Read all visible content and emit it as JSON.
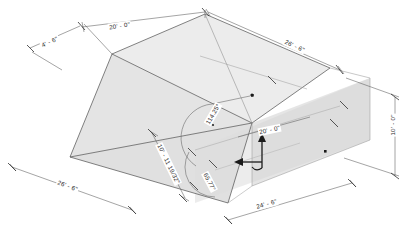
{
  "view": {
    "name": "3d-isometric-model-view",
    "background_color": "#ffffff",
    "line_color": "#4a4a4a",
    "dim_line_color": "#5a5a5a",
    "face_fill_top": "#e9e9e9",
    "face_fill_front": "#dedede",
    "face_fill_side": "#d6d6d6",
    "text_color": "#2b2b2b"
  },
  "dimensions": {
    "top_left_short": {
      "label": "4' - 6\"",
      "rotation": -29
    },
    "top_ridge": {
      "label": "20' - 0\"",
      "rotation": -17
    },
    "top_right_long": {
      "label": "26' - 6\"",
      "rotation": 27
    },
    "right_height": {
      "label": "10' - 0\"",
      "rotation": -90
    },
    "bottom_right_base": {
      "label": "24' - 6\"",
      "rotation": 12
    },
    "bottom_left_base": {
      "label": "26' - 6\"",
      "rotation": 27
    },
    "slope_length": {
      "label": "10' - 11 19/32\"",
      "rotation": 63
    },
    "interior_run": {
      "label": "20' - 0\"",
      "rotation": -10
    }
  },
  "angles": {
    "upper": {
      "label": "114.25°",
      "rotation": -62
    },
    "lower": {
      "label": "65.77°",
      "rotation": 63
    }
  },
  "cursor": {
    "name": "move-gizmo-cursor",
    "vertical_arrow": "up-arrow",
    "horizontal_arrow": "left-arrow"
  },
  "markers": {
    "tick_style": "slash",
    "grip_color": "#1a1a1a"
  }
}
